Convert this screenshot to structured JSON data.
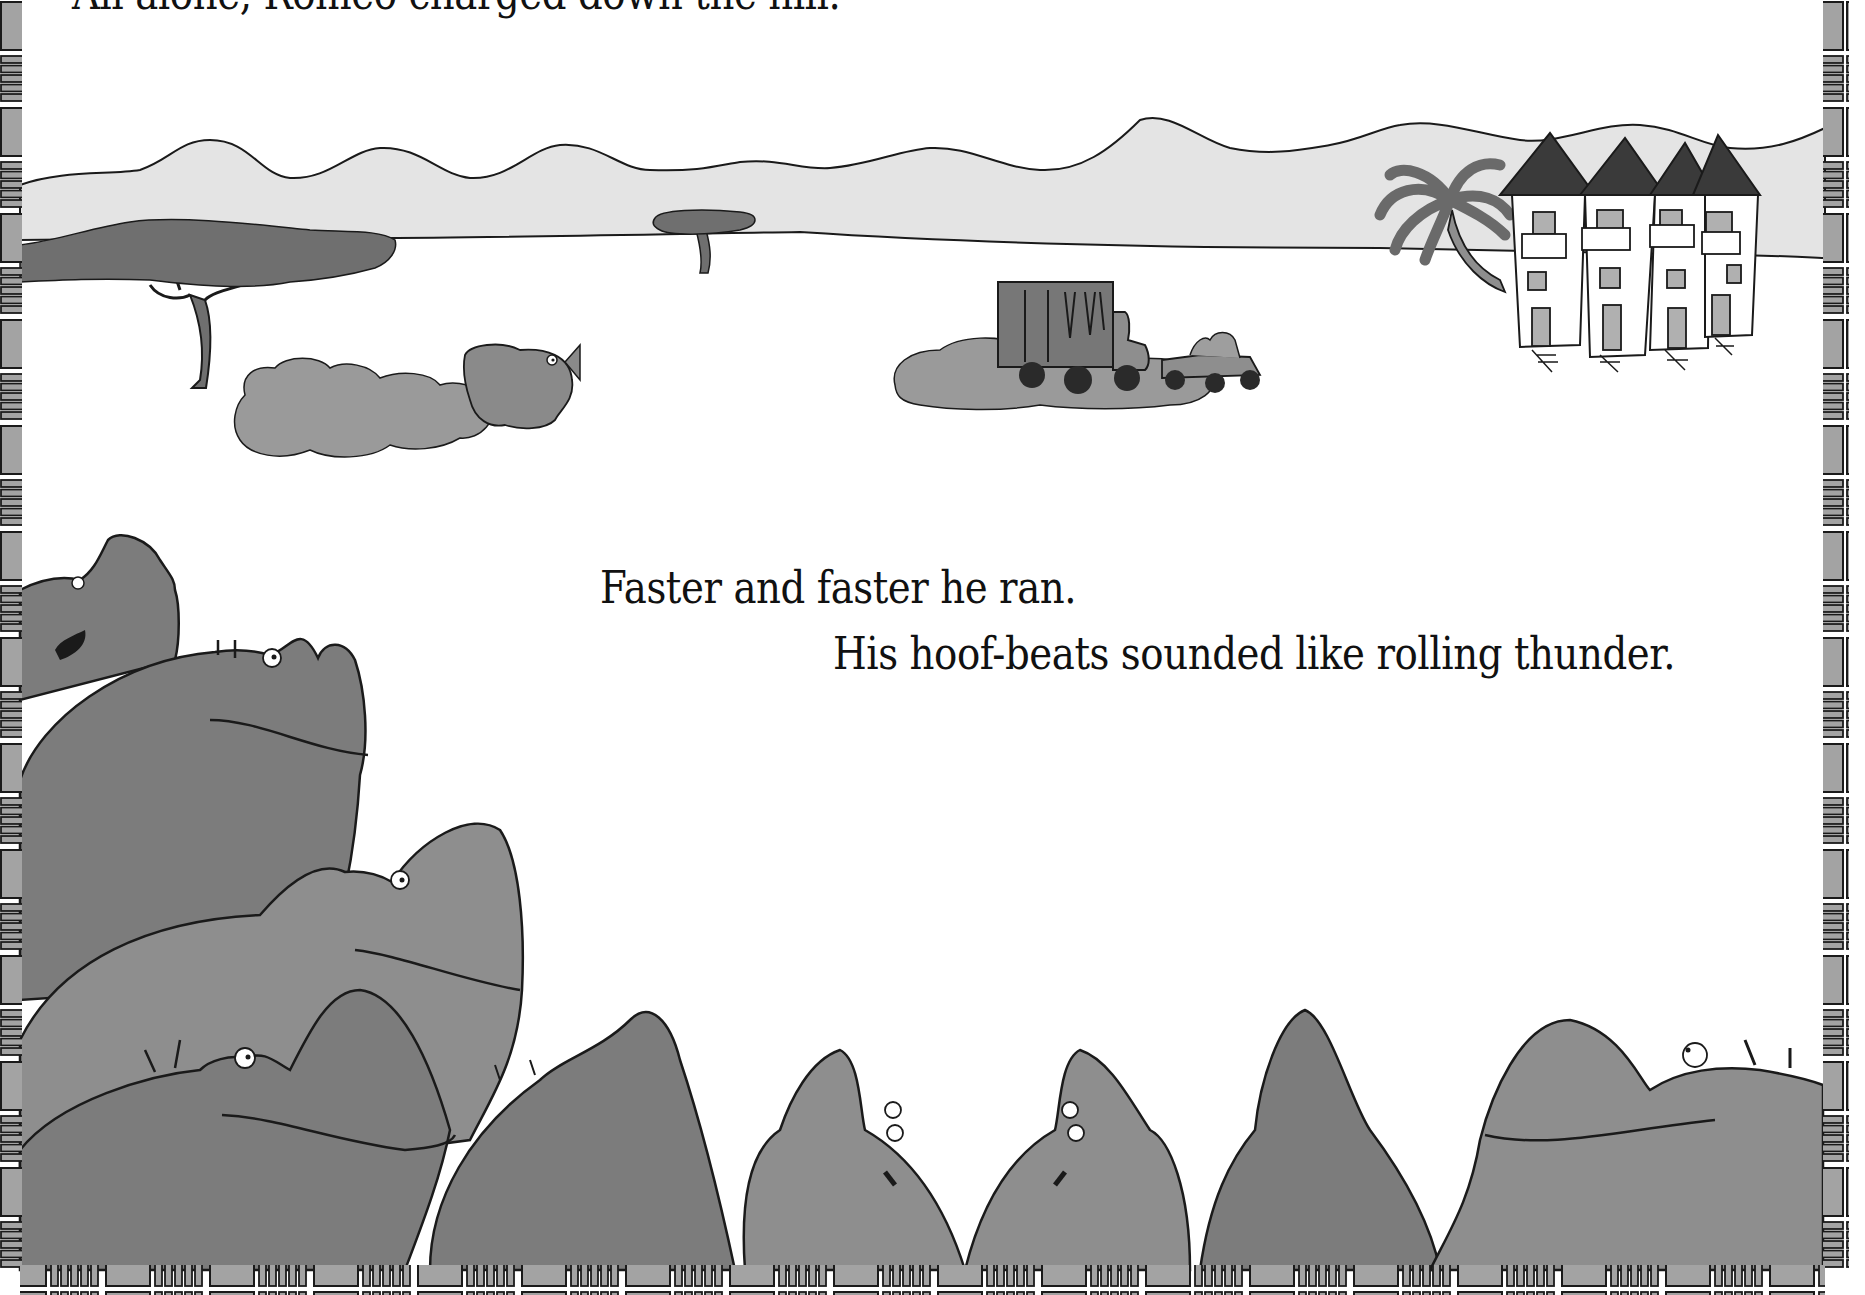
{
  "page": {
    "type": "picture-book-spread",
    "colors": {
      "background": "#ffffff",
      "ink": "#111111",
      "hills": "#e4e4e4",
      "tree": "#6f6f6f",
      "hippo_light": "#8e8e8e",
      "hippo_dark": "#7c7c7c",
      "dust": "#9a9a9a",
      "border_fill": "#a3a3a3"
    }
  },
  "text": {
    "top_line": "All alone, Romeo charged down the hill.",
    "line_1": "Faster and faster he ran.",
    "line_2": "His hoof-beats sounded like rolling thunder."
  },
  "illustration": {
    "scene": "savanna landscape with hills, acacia trees, village huts and palm tree",
    "elements": [
      "hills",
      "large-acacia-tree",
      "small-acacia-tree",
      "palm-tree",
      "thatched-huts-x4",
      "charging-rhino-romeo-with-dust-cloud",
      "truck-and-jeep-with-dust-cloud",
      "hippo-herd-foreground"
    ],
    "hippo_count": 9
  },
  "border": {
    "style": "slatted-frame",
    "sides": [
      "left",
      "right",
      "bottom"
    ]
  }
}
